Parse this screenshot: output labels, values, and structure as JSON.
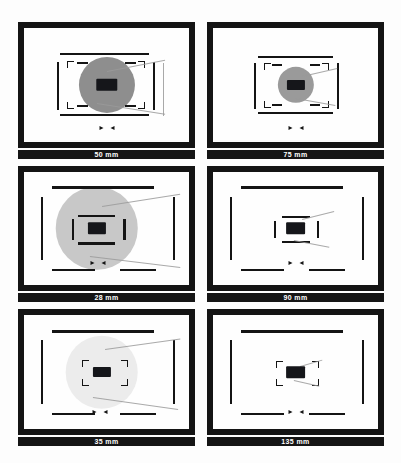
{
  "figure": {
    "title": "",
    "panel_count": 6,
    "background_color": "#fdfdfd",
    "frame_color": "#141414",
    "label_bar_color": "#151515",
    "label_text_color": "#ffffff"
  },
  "panels": [
    {
      "id": "panel-50mm",
      "label": "50 mm",
      "focal_length_mm": 50,
      "circle": {
        "present": true,
        "diameter_pct": 34,
        "fill": "#8e8e8e",
        "cx_pct": 50,
        "cy_pct": 50
      },
      "spot": {
        "width_pct": 13,
        "height_pct": 11,
        "fill": "#15161a"
      },
      "bars": {
        "top_h": {
          "left_pct": 22,
          "width_pct": 54,
          "top_pct": 22
        },
        "bottom_h": {
          "left_pct": 22,
          "width_pct": 54,
          "top_pct": 76
        },
        "left_v": {
          "left_pct": 20,
          "top_pct": 30,
          "height_pct": 42
        },
        "right_v": {
          "left_pct": 78,
          "top_pct": 30,
          "height_pct": 42
        }
      },
      "corner_brackets": 4,
      "dash_ticks": 4,
      "triangles": {
        "present": true,
        "cx_pct": 50,
        "cy_pct": 88
      }
    },
    {
      "id": "panel-75mm",
      "label": "75 mm",
      "focal_length_mm": 75,
      "circle": {
        "present": true,
        "diameter_pct": 22,
        "fill": "#9a9a9a",
        "cx_pct": 50,
        "cy_pct": 50
      },
      "spot": {
        "width_pct": 11,
        "height_pct": 9,
        "fill": "#15161a"
      },
      "bars": {
        "top_h": {
          "left_pct": 27,
          "width_pct": 46,
          "top_pct": 25
        },
        "bottom_h": {
          "left_pct": 27,
          "width_pct": 46,
          "top_pct": 74
        },
        "left_v": {
          "left_pct": 25,
          "top_pct": 31,
          "height_pct": 40
        },
        "right_v": {
          "left_pct": 75,
          "top_pct": 31,
          "height_pct": 40
        }
      },
      "corner_brackets": 4,
      "dash_ticks": 4,
      "triangles": {
        "present": true,
        "cx_pct": 50,
        "cy_pct": 88
      }
    },
    {
      "id": "panel-28mm",
      "label": "28 mm",
      "focal_length_mm": 28,
      "circle": {
        "present": true,
        "diameter_pct": 50,
        "fill": "#c8c8c8",
        "cx_pct": 44,
        "cy_pct": 50
      },
      "spot": {
        "width_pct": 11,
        "height_pct": 10,
        "fill": "#15161a"
      },
      "bars": {
        "top_h": {
          "left_pct": 17,
          "width_pct": 62,
          "top_pct": 13
        },
        "bottom_h": {
          "left_pct": 17,
          "width_pct": 26,
          "top_pct": 86
        },
        "bottom_h2": {
          "left_pct": 58,
          "width_pct": 22,
          "top_pct": 86
        },
        "left_v": {
          "left_pct": 10,
          "top_pct": 22,
          "height_pct": 56
        },
        "right_v": {
          "left_pct": 90,
          "top_pct": 22,
          "height_pct": 56
        }
      },
      "inner_bars": {
        "top_h": {
          "left_pct": 33,
          "width_pct": 22,
          "top_pct": 38
        },
        "bottom_h": {
          "left_pct": 33,
          "width_pct": 22,
          "top_pct": 62
        },
        "left_v": {
          "left_pct": 29,
          "top_pct": 42,
          "height_pct": 18
        },
        "right_v": {
          "left_pct": 60,
          "top_pct": 42,
          "height_pct": 18
        }
      },
      "corner_brackets": 0,
      "triangles": {
        "present": true,
        "cx_pct": 45,
        "cy_pct": 80
      }
    },
    {
      "id": "panel-90mm",
      "label": "90 mm",
      "focal_length_mm": 90,
      "circle": {
        "present": false,
        "diameter_pct": 0,
        "fill": "#ffffff",
        "cx_pct": 50,
        "cy_pct": 50
      },
      "spot": {
        "width_pct": 12,
        "height_pct": 10,
        "fill": "#15161a"
      },
      "bars": {
        "top_h": {
          "left_pct": 17,
          "width_pct": 62,
          "top_pct": 13
        },
        "bottom_h": {
          "left_pct": 17,
          "width_pct": 26,
          "top_pct": 86
        },
        "bottom_h2": {
          "left_pct": 58,
          "width_pct": 22,
          "top_pct": 86
        },
        "left_v": {
          "left_pct": 10,
          "top_pct": 22,
          "height_pct": 56
        },
        "right_v": {
          "left_pct": 90,
          "top_pct": 22,
          "height_pct": 56
        }
      },
      "inner_bars": {
        "top_h": {
          "left_pct": 42,
          "width_pct": 17,
          "top_pct": 39
        },
        "bottom_h": {
          "left_pct": 42,
          "width_pct": 17,
          "top_pct": 61
        },
        "left_v": {
          "left_pct": 37,
          "top_pct": 43,
          "height_pct": 15
        },
        "right_v": {
          "left_pct": 63,
          "top_pct": 43,
          "height_pct": 15
        }
      },
      "corner_brackets": 0,
      "triangles": {
        "present": true,
        "cx_pct": 50,
        "cy_pct": 80
      }
    },
    {
      "id": "panel-35mm",
      "label": "35 mm",
      "focal_length_mm": 35,
      "circle": {
        "present": true,
        "diameter_pct": 44,
        "fill": "#ececec",
        "cx_pct": 47,
        "cy_pct": 50
      },
      "spot": {
        "width_pct": 11,
        "height_pct": 9,
        "fill": "#15161a"
      },
      "bars": {
        "top_h": {
          "left_pct": 17,
          "width_pct": 62,
          "top_pct": 13
        },
        "bottom_h": {
          "left_pct": 17,
          "width_pct": 26,
          "top_pct": 86
        },
        "bottom_h2": {
          "left_pct": 58,
          "width_pct": 22,
          "top_pct": 86
        },
        "left_v": {
          "left_pct": 10,
          "top_pct": 22,
          "height_pct": 56
        },
        "right_v": {
          "left_pct": 90,
          "top_pct": 22,
          "height_pct": 56
        }
      },
      "corner_brackets": 4,
      "triangles": {
        "present": true,
        "cx_pct": 46,
        "cy_pct": 85
      }
    },
    {
      "id": "panel-135mm",
      "label": "135 mm",
      "focal_length_mm": 135,
      "circle": {
        "present": false,
        "diameter_pct": 0,
        "fill": "#ffffff",
        "cx_pct": 50,
        "cy_pct": 50
      },
      "spot": {
        "width_pct": 12,
        "height_pct": 10,
        "fill": "#15161a"
      },
      "bars": {
        "top_h": {
          "left_pct": 17,
          "width_pct": 62,
          "top_pct": 13
        },
        "bottom_h": {
          "left_pct": 17,
          "width_pct": 26,
          "top_pct": 86
        },
        "bottom_h2": {
          "left_pct": 58,
          "width_pct": 22,
          "top_pct": 86
        },
        "left_v": {
          "left_pct": 10,
          "top_pct": 22,
          "height_pct": 56
        },
        "right_v": {
          "left_pct": 90,
          "top_pct": 22,
          "height_pct": 56
        }
      },
      "corner_brackets": 4,
      "triangles": {
        "present": true,
        "cx_pct": 50,
        "cy_pct": 85
      }
    }
  ]
}
